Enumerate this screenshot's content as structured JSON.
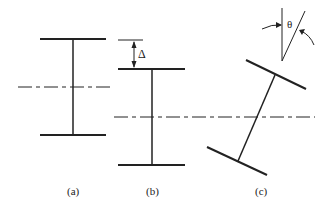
{
  "figure": {
    "panels": [
      {
        "id": "a",
        "label": "(a)"
      },
      {
        "id": "b",
        "label": "(b)"
      },
      {
        "id": "c",
        "label": "(c)"
      }
    ],
    "symbols": {
      "delta": "Δ",
      "theta": "θ"
    }
  }
}
